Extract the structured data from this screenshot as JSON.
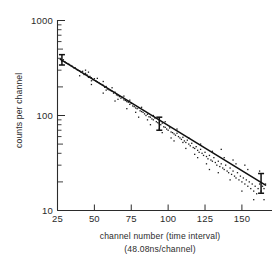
{
  "chart_data": {
    "type": "scatter",
    "title": "",
    "subtitle": "",
    "xlabel": "channel number (time interval)",
    "xlabel_line2": "(48.08ns/channel)",
    "ylabel": "counts per channel",
    "xscale": "linear",
    "yscale": "log",
    "xlim": [
      25,
      166
    ],
    "ylim": [
      10,
      1000
    ],
    "grid": false,
    "legend": null,
    "xticks": [
      25,
      50,
      75,
      100,
      125,
      150
    ],
    "xtick_labels": [
      "25",
      "50",
      "75",
      "100",
      "125",
      "150"
    ],
    "yticks": [
      10,
      100,
      1000
    ],
    "ytick_labels": [
      "10",
      "100",
      "1000"
    ],
    "yminor_ticks": [
      20,
      30,
      40,
      50,
      60,
      70,
      80,
      90,
      200,
      300,
      400,
      500,
      600,
      700,
      800,
      900
    ],
    "fit_line": {
      "name": "exponential fit",
      "x": [
        27,
        166
      ],
      "y": [
        390,
        18.5
      ],
      "decay_form": "N = N0 * exp(-t/tau)"
    },
    "error_bars": [
      {
        "x": 28,
        "y": 385,
        "yerr_low": 340,
        "yerr_high": 437
      },
      {
        "x": 94,
        "y": 82,
        "yerr_low": 70,
        "yerr_high": 96
      },
      {
        "x": 163,
        "y": 19,
        "yerr_low": 15.2,
        "yerr_high": 24.5
      }
    ],
    "series": [
      {
        "name": "counts per channel",
        "marker": "dot",
        "points": [
          [
            27,
            392
          ],
          [
            28,
            372
          ],
          [
            29,
            386
          ],
          [
            30,
            368
          ],
          [
            31,
            356
          ],
          [
            32,
            352
          ],
          [
            33,
            345
          ],
          [
            34,
            336
          ],
          [
            35,
            330
          ],
          [
            36,
            318
          ],
          [
            37,
            318
          ],
          [
            38,
            305
          ],
          [
            39,
            299
          ],
          [
            40,
            296
          ],
          [
            41,
            286
          ],
          [
            42,
            292
          ],
          [
            43,
            270
          ],
          [
            44,
            278
          ],
          [
            45,
            268
          ],
          [
            46,
            252
          ],
          [
            47,
            258
          ],
          [
            48,
            250
          ],
          [
            49,
            238
          ],
          [
            50,
            244
          ],
          [
            51,
            232
          ],
          [
            52,
            226
          ],
          [
            53,
            222
          ],
          [
            54,
            216
          ],
          [
            55,
            212
          ],
          [
            56,
            208
          ],
          [
            57,
            198
          ],
          [
            58,
            202
          ],
          [
            59,
            190
          ],
          [
            60,
            186
          ],
          [
            61,
            183
          ],
          [
            62,
            180
          ],
          [
            63,
            172
          ],
          [
            64,
            176
          ],
          [
            65,
            165
          ],
          [
            66,
            162
          ],
          [
            67,
            158
          ],
          [
            68,
            152
          ],
          [
            69,
            155
          ],
          [
            70,
            146
          ],
          [
            71,
            144
          ],
          [
            72,
            140
          ],
          [
            73,
            138
          ],
          [
            74,
            131
          ],
          [
            75,
            134
          ],
          [
            76,
            126
          ],
          [
            77,
            124
          ],
          [
            78,
            120
          ],
          [
            79,
            118
          ],
          [
            80,
            121
          ],
          [
            81,
            112
          ],
          [
            82,
            110
          ],
          [
            83,
            108
          ],
          [
            84,
            104
          ],
          [
            85,
            100
          ],
          [
            86,
            103
          ],
          [
            87,
            97
          ],
          [
            88,
            96
          ],
          [
            89,
            92
          ],
          [
            90,
            90
          ],
          [
            91,
            94
          ],
          [
            92,
            86
          ],
          [
            93,
            84
          ],
          [
            94,
            82
          ],
          [
            95,
            80
          ],
          [
            96,
            83
          ],
          [
            97,
            76
          ],
          [
            98,
            75
          ],
          [
            99,
            72
          ],
          [
            100,
            70
          ],
          [
            101,
            74
          ],
          [
            102,
            67
          ],
          [
            103,
            66
          ],
          [
            104,
            64
          ],
          [
            105,
            62
          ],
          [
            106,
            65
          ],
          [
            107,
            60
          ],
          [
            108,
            58
          ],
          [
            109,
            56
          ],
          [
            110,
            59
          ],
          [
            111,
            54
          ],
          [
            112,
            52
          ],
          [
            113,
            55
          ],
          [
            114,
            50
          ],
          [
            115,
            48
          ],
          [
            116,
            51
          ],
          [
            117,
            46
          ],
          [
            118,
            45
          ],
          [
            119,
            47
          ],
          [
            120,
            43
          ],
          [
            121,
            41
          ],
          [
            122,
            44
          ],
          [
            123,
            40
          ],
          [
            124,
            38
          ],
          [
            125,
            41
          ],
          [
            126,
            37
          ],
          [
            127,
            35
          ],
          [
            128,
            38
          ],
          [
            129,
            34
          ],
          [
            130,
            33
          ],
          [
            131,
            36
          ],
          [
            132,
            32
          ],
          [
            133,
            30
          ],
          [
            134,
            33
          ],
          [
            135,
            29
          ],
          [
            136,
            31
          ],
          [
            137,
            28
          ],
          [
            138,
            27
          ],
          [
            139,
            30
          ],
          [
            140,
            26
          ],
          [
            141,
            25
          ],
          [
            142,
            28
          ],
          [
            143,
            24
          ],
          [
            144,
            26
          ],
          [
            145,
            23
          ],
          [
            146,
            22
          ],
          [
            147,
            25
          ],
          [
            148,
            21
          ],
          [
            149,
            23
          ],
          [
            150,
            20
          ],
          [
            151,
            22
          ],
          [
            152,
            19
          ],
          [
            153,
            21
          ],
          [
            154,
            18
          ],
          [
            155,
            20
          ],
          [
            156,
            17
          ],
          [
            157,
            19
          ],
          [
            158,
            16
          ],
          [
            159,
            18
          ],
          [
            160,
            15
          ],
          [
            161,
            17
          ],
          [
            162,
            19
          ],
          [
            163,
            16
          ],
          [
            164,
            18
          ],
          [
            165,
            17
          ],
          [
            166,
            19
          ],
          [
            44,
            300
          ],
          [
            46,
            286
          ],
          [
            48,
            232
          ],
          [
            52,
            246
          ],
          [
            56,
            228
          ],
          [
            58,
            185
          ],
          [
            62,
            196
          ],
          [
            66,
            148
          ],
          [
            70,
            160
          ],
          [
            74,
            145
          ],
          [
            78,
            108
          ],
          [
            82,
            122
          ],
          [
            86,
            90
          ],
          [
            90,
            100
          ],
          [
            94,
            72
          ],
          [
            98,
            86
          ],
          [
            102,
            58
          ],
          [
            106,
            72
          ],
          [
            110,
            52
          ],
          [
            114,
            58
          ],
          [
            118,
            39
          ],
          [
            122,
            50
          ],
          [
            126,
            31
          ],
          [
            130,
            42
          ],
          [
            134,
            25
          ],
          [
            138,
            36
          ],
          [
            142,
            21
          ],
          [
            146,
            31
          ],
          [
            150,
            16
          ],
          [
            154,
            27
          ],
          [
            158,
            13
          ],
          [
            162,
            26
          ],
          [
            165,
            13
          ],
          [
            136,
            44
          ],
          [
            144,
            34
          ],
          [
            152,
            30
          ],
          [
            128,
            27
          ],
          [
            120,
            36
          ],
          [
            112,
            45
          ],
          [
            104,
            54
          ],
          [
            96,
            66
          ],
          [
            88,
            80
          ],
          [
            80,
            96
          ],
          [
            72,
            118
          ],
          [
            64,
            142
          ],
          [
            56,
            172
          ],
          [
            48,
            212
          ],
          [
            40,
            262
          ]
        ]
      }
    ],
    "annotations": []
  }
}
